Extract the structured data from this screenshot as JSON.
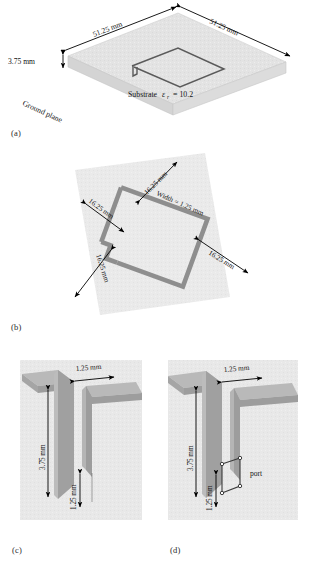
{
  "figure": {
    "caption_labels": {
      "a": "(a)",
      "b": "(b)",
      "c": "(c)",
      "d": "(d)"
    },
    "colors": {
      "substrate_top": "#e0e0e0",
      "substrate_side": "#d2d2d2",
      "substrate_front": "#dcdcdc",
      "panel_background": "#ebebeb",
      "conductor_gray": "#9a9a9a",
      "conductor_light": "#bdbdbd",
      "outline": "#4a4a4a",
      "arrow": "#000000",
      "text": "#141414"
    }
  },
  "panel_a": {
    "name": "substrate-with-square-loop-antenna",
    "labels": {
      "length_left": "51.25 mm",
      "length_right": "51.25 mm",
      "thickness": "3.75 mm",
      "substrate": "Substrate εr = 10.2",
      "substrate_prefix": "Substrate",
      "substrate_symbol": "ε",
      "substrate_subscript": "r",
      "substrate_value": "= 10.2",
      "ground_plane": "Ground plane"
    }
  },
  "panel_b": {
    "name": "square-loop-dimensions-top-view",
    "labels": {
      "top_left": "16.25 mm",
      "upper_left": "16.25 mm",
      "lower_left": "16.25 mm",
      "right": "16.25 mm",
      "width": "Width = 1.25 mm"
    }
  },
  "panel_c": {
    "name": "feed-gap-detail",
    "labels": {
      "gap_width": "1.25 mm",
      "height": "3.75 mm",
      "stub_height": "1.25 mm"
    }
  },
  "panel_d": {
    "name": "feed-gap-detail-with-port",
    "labels": {
      "gap_width": "1.25 mm",
      "height": "3.75 mm",
      "stub_height": "1.25 mm",
      "port": "port"
    }
  }
}
